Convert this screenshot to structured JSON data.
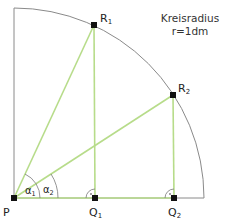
{
  "note": {
    "line1": "Kreisradius",
    "line2": "r=1dm"
  },
  "points": {
    "P": {
      "label": "P",
      "sub": ""
    },
    "R1": {
      "label": "R",
      "sub": "1"
    },
    "R2": {
      "label": "R",
      "sub": "2"
    },
    "Q1": {
      "label": "Q",
      "sub": "1"
    },
    "Q2": {
      "label": "Q",
      "sub": "2"
    }
  },
  "angles": {
    "a1": {
      "label": "α",
      "sub": "1"
    },
    "a2": {
      "label": "α",
      "sub": "2"
    }
  },
  "right_angle_mark": "·",
  "colors": {
    "circle": "#8a8a8a",
    "green": "#b7dc8a",
    "point": "#111111"
  }
}
